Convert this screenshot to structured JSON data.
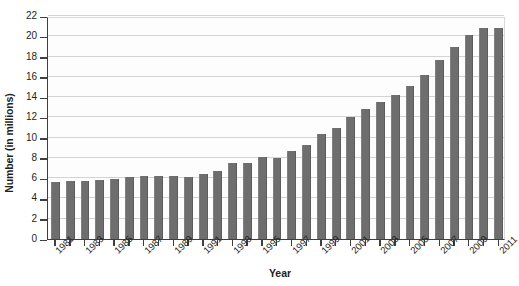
{
  "chart_data": {
    "type": "bar",
    "title": "",
    "xlabel": "Year",
    "ylabel": "Number (in millions)",
    "ylim": [
      0,
      22
    ],
    "ytick_step": 2,
    "yticks": [
      0,
      2,
      4,
      6,
      8,
      10,
      12,
      14,
      16,
      18,
      20,
      22
    ],
    "grid": true,
    "legend": "none",
    "bar_color": "#6e6e6e",
    "axis_color": "#3f3f3f",
    "gridline_color": "#d3d3d3",
    "categories": [
      "1981",
      "1982",
      "1983",
      "1984",
      "1985",
      "1986",
      "1987",
      "1988",
      "1989",
      "1990",
      "1991",
      "1992",
      "1993",
      "1994",
      "1995",
      "1996",
      "1997",
      "1998",
      "1999",
      "2000",
      "2001",
      "2002",
      "2003",
      "2004",
      "2005",
      "2006",
      "2007",
      "2008",
      "2009",
      "2010",
      "2011"
    ],
    "tick_labels_shown": [
      "1981",
      "1983",
      "1985",
      "1987",
      "1989",
      "1991",
      "1993",
      "1995",
      "1997",
      "1999",
      "2001",
      "2003",
      "2005",
      "2007",
      "2009",
      "2011"
    ],
    "values": [
      5.6,
      5.7,
      5.7,
      5.8,
      5.9,
      6.1,
      6.2,
      6.2,
      6.2,
      6.1,
      6.4,
      6.7,
      7.5,
      7.5,
      8.1,
      8.0,
      8.7,
      9.3,
      10.4,
      11.0,
      12.0,
      12.8,
      13.5,
      14.2,
      15.1,
      16.2,
      17.7,
      18.9,
      20.1,
      20.8,
      20.8
    ]
  }
}
